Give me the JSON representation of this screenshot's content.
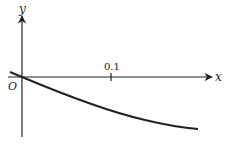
{
  "diagram": {
    "type": "function-graph",
    "axes": {
      "x_label": "x",
      "y_label": "y",
      "origin_label": "O",
      "x_tick_label": "0.1"
    },
    "curve": {
      "description": "decreasing concave-down curve passing through origin",
      "color": "#222222"
    }
  }
}
